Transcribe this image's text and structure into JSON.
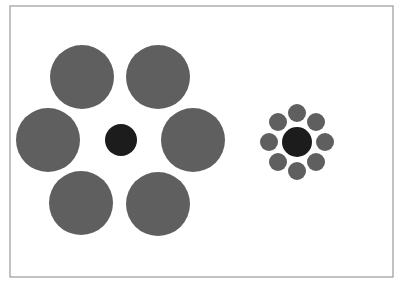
{
  "colors": {
    "surround": "#5f5f5f",
    "center": "#1c1c1c",
    "frame": "#9a9a9a",
    "background": "#ffffff"
  },
  "frame": {
    "x": 10,
    "y": 6,
    "width": 383,
    "height": 271
  },
  "left_group": {
    "center": {
      "cx": 121,
      "cy": 140,
      "r": 16
    },
    "surround": [
      {
        "cx": 82,
        "cy": 77,
        "r": 32
      },
      {
        "cx": 158,
        "cy": 77,
        "r": 32
      },
      {
        "cx": 48,
        "cy": 140,
        "r": 32
      },
      {
        "cx": 193,
        "cy": 140,
        "r": 32
      },
      {
        "cx": 81,
        "cy": 203,
        "r": 32
      },
      {
        "cx": 158,
        "cy": 204,
        "r": 32
      }
    ]
  },
  "right_group": {
    "center": {
      "cx": 297,
      "cy": 142,
      "r": 15
    },
    "surround": [
      {
        "cx": 297,
        "cy": 113,
        "r": 9
      },
      {
        "cx": 278,
        "cy": 122,
        "r": 9
      },
      {
        "cx": 316,
        "cy": 122,
        "r": 9
      },
      {
        "cx": 269,
        "cy": 142,
        "r": 9
      },
      {
        "cx": 325,
        "cy": 142,
        "r": 9
      },
      {
        "cx": 278,
        "cy": 162,
        "r": 9
      },
      {
        "cx": 316,
        "cy": 162,
        "r": 9
      },
      {
        "cx": 297,
        "cy": 171,
        "r": 9
      }
    ]
  }
}
